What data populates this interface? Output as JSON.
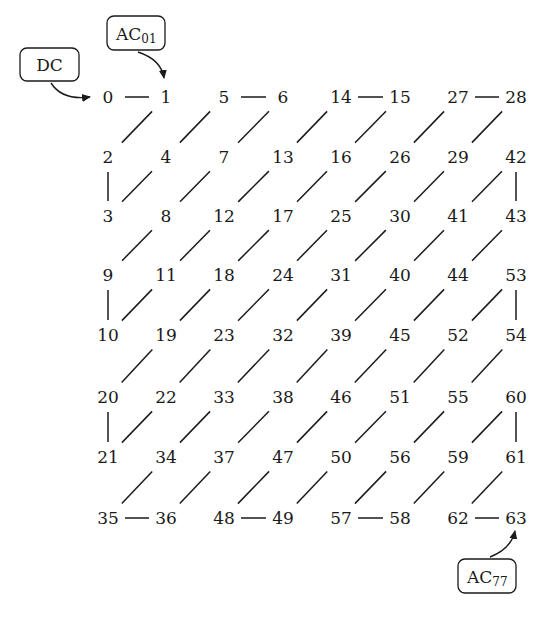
{
  "diagram": {
    "grid": [
      [
        0,
        1,
        5,
        6,
        14,
        15,
        27,
        28
      ],
      [
        2,
        4,
        7,
        13,
        16,
        26,
        29,
        42
      ],
      [
        3,
        8,
        12,
        17,
        25,
        30,
        41,
        43
      ],
      [
        9,
        11,
        18,
        24,
        31,
        40,
        44,
        53
      ],
      [
        10,
        19,
        23,
        32,
        39,
        45,
        52,
        54
      ],
      [
        20,
        22,
        33,
        38,
        46,
        51,
        55,
        60
      ],
      [
        21,
        34,
        37,
        47,
        50,
        56,
        59,
        61
      ],
      [
        35,
        36,
        48,
        49,
        57,
        58,
        62,
        63
      ]
    ],
    "callouts": [
      {
        "id": "dc",
        "text": "DC",
        "sub": "",
        "target": "0"
      },
      {
        "id": "ac01",
        "text": "AC",
        "sub": "01",
        "target": "1"
      },
      {
        "id": "ac77",
        "text": "AC",
        "sub": "77",
        "target": "63"
      }
    ]
  }
}
